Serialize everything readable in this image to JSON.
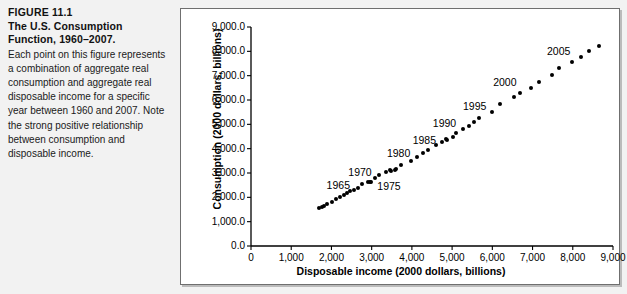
{
  "caption": {
    "figure_number": "FIGURE 11.1",
    "title": "The U.S. Consumption Function, 1960–2007.",
    "body": "Each point on this figure represents a combination of aggregate real consumption and aggregate real disposable income for a specific year between 1960 and 2007. Note the strong positive relationship between consumption and disposable income."
  },
  "chart_data": {
    "type": "scatter",
    "title": "",
    "xlabel": "Disposable income (2000 dollars, billions)",
    "ylabel": "Consumption (2000 dollars, billions)",
    "xlim": [
      0,
      9000
    ],
    "ylim": [
      0,
      9000
    ],
    "xticks": [
      0,
      1000,
      2000,
      3000,
      4000,
      5000,
      6000,
      7000,
      8000,
      9000
    ],
    "xtick_labels": [
      "0",
      "1,000",
      "2,000",
      "3,000",
      "4,000",
      "5,000",
      "6,000",
      "7,000",
      "8,000",
      "9,000"
    ],
    "yticks": [
      0,
      1000,
      2000,
      3000,
      4000,
      5000,
      6000,
      7000,
      8000,
      9000
    ],
    "ytick_labels": [
      "0.0",
      "1,000.0",
      "2,000.0",
      "3,000.0",
      "4,000.0",
      "5,000.0",
      "6,000.0",
      "7,000.0",
      "8,000.0",
      "9,000.0"
    ],
    "grid": false,
    "legend": null,
    "marker": "filled-circle",
    "marker_color": "#000000",
    "series": [
      {
        "name": "U.S. consumption vs. disposable income, 1960–2007",
        "points": [
          {
            "year": 1960,
            "x": 1700,
            "y": 1570
          },
          {
            "year": 1961,
            "x": 1760,
            "y": 1600
          },
          {
            "year": 1962,
            "x": 1820,
            "y": 1660
          },
          {
            "year": 1963,
            "x": 1890,
            "y": 1720
          },
          {
            "year": 1964,
            "x": 2010,
            "y": 1820
          },
          {
            "year": 1965,
            "x": 2120,
            "y": 1930
          },
          {
            "year": 1966,
            "x": 2210,
            "y": 2030
          },
          {
            "year": 1967,
            "x": 2300,
            "y": 2080
          },
          {
            "year": 1968,
            "x": 2390,
            "y": 2190
          },
          {
            "year": 1969,
            "x": 2460,
            "y": 2270
          },
          {
            "year": 1970,
            "x": 2570,
            "y": 2320
          },
          {
            "year": 1971,
            "x": 2660,
            "y": 2400
          },
          {
            "year": 1972,
            "x": 2770,
            "y": 2540
          },
          {
            "year": 1973,
            "x": 2960,
            "y": 2640
          },
          {
            "year": 1974,
            "x": 2920,
            "y": 2610
          },
          {
            "year": 1975,
            "x": 2990,
            "y": 2650
          },
          {
            "year": 1976,
            "x": 3080,
            "y": 2790
          },
          {
            "year": 1977,
            "x": 3180,
            "y": 2900
          },
          {
            "year": 1978,
            "x": 3360,
            "y": 3030
          },
          {
            "year": 1979,
            "x": 3450,
            "y": 3110
          },
          {
            "year": 1980,
            "x": 3470,
            "y": 3080
          },
          {
            "year": 1981,
            "x": 3570,
            "y": 3130
          },
          {
            "year": 1982,
            "x": 3600,
            "y": 3180
          },
          {
            "year": 1983,
            "x": 3720,
            "y": 3340
          },
          {
            "year": 1984,
            "x": 3980,
            "y": 3490
          },
          {
            "year": 1985,
            "x": 4130,
            "y": 3670
          },
          {
            "year": 1986,
            "x": 4280,
            "y": 3840
          },
          {
            "year": 1987,
            "x": 4390,
            "y": 3960
          },
          {
            "year": 1988,
            "x": 4610,
            "y": 4140
          },
          {
            "year": 1989,
            "x": 4750,
            "y": 4280
          },
          {
            "year": 1990,
            "x": 4860,
            "y": 4390
          },
          {
            "year": 1991,
            "x": 4870,
            "y": 4360
          },
          {
            "year": 1992,
            "x": 5030,
            "y": 4490
          },
          {
            "year": 1993,
            "x": 5090,
            "y": 4630
          },
          {
            "year": 1994,
            "x": 5260,
            "y": 4820
          },
          {
            "year": 1995,
            "x": 5410,
            "y": 4940
          },
          {
            "year": 1996,
            "x": 5540,
            "y": 5080
          },
          {
            "year": 1997,
            "x": 5680,
            "y": 5240
          },
          {
            "year": 1998,
            "x": 5990,
            "y": 5520
          },
          {
            "year": 1999,
            "x": 6200,
            "y": 5830
          },
          {
            "year": 2000,
            "x": 6540,
            "y": 6130
          },
          {
            "year": 2001,
            "x": 6700,
            "y": 6300
          },
          {
            "year": 2002,
            "x": 6950,
            "y": 6500
          },
          {
            "year": 2003,
            "x": 7150,
            "y": 6750
          },
          {
            "year": 2004,
            "x": 7480,
            "y": 7040
          },
          {
            "year": 2005,
            "x": 7650,
            "y": 7300
          },
          {
            "year": 2006,
            "x": 7990,
            "y": 7560
          },
          {
            "year": 2007,
            "x": 8200,
            "y": 7760
          },
          {
            "year": 2008,
            "x": 8400,
            "y": 8010
          },
          {
            "year": 2009,
            "x": 8640,
            "y": 8220
          }
        ]
      }
    ],
    "annotations": [
      {
        "text": "1965",
        "x": 1880,
        "y": 2480
      },
      {
        "text": "1970",
        "x": 2420,
        "y": 3000
      },
      {
        "text": "1975",
        "x": 3140,
        "y": 2440
      },
      {
        "text": "1980",
        "x": 3380,
        "y": 3800
      },
      {
        "text": "1985",
        "x": 4020,
        "y": 4330
      },
      {
        "text": "1990",
        "x": 4520,
        "y": 5020
      },
      {
        "text": "1995",
        "x": 5270,
        "y": 5700
      },
      {
        "text": "2000",
        "x": 6020,
        "y": 6700
      },
      {
        "text": "2005",
        "x": 7360,
        "y": 7990
      }
    ]
  }
}
